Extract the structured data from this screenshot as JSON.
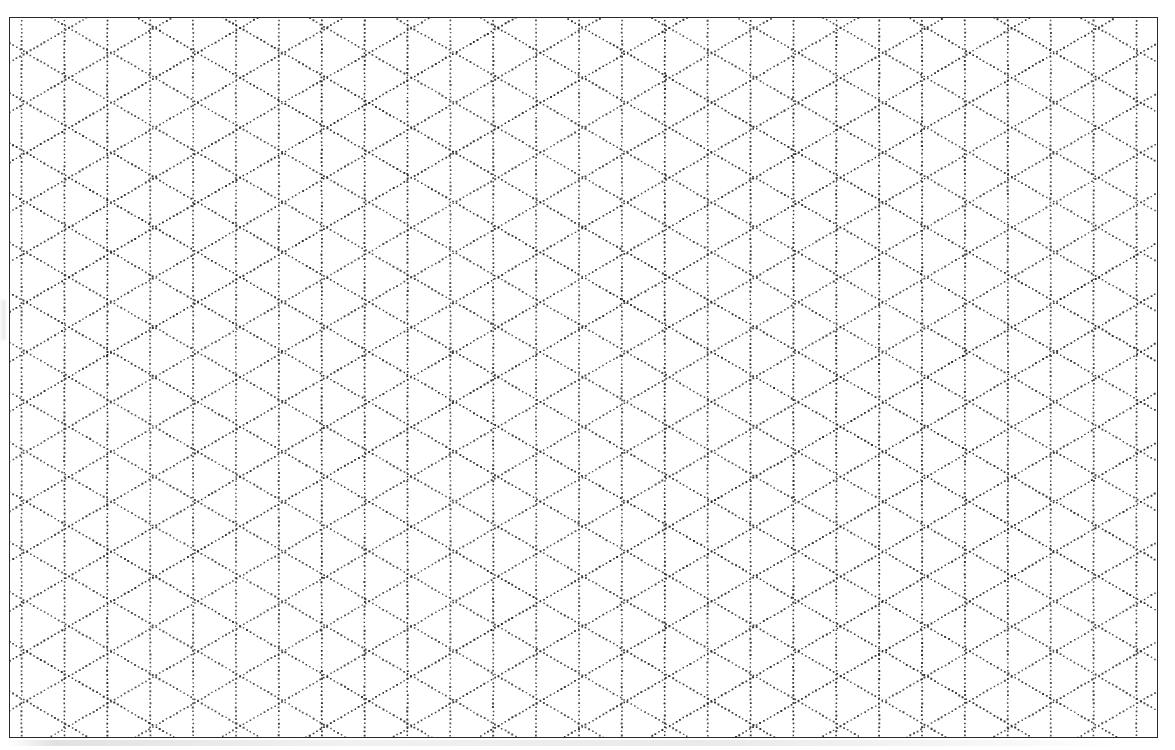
{
  "document": {
    "kind": "isometric-dot-grid-paper",
    "title": "Isometric Dot Grid Paper",
    "page_width": 1175,
    "page_height": 750,
    "background_color": "#ffffff"
  },
  "border": {
    "x": 9,
    "y": 17,
    "width": 1149,
    "height": 721,
    "stroke_color": "#2a2a2a",
    "stroke_width": 1.4
  },
  "grid": {
    "type": "isometric-triangular",
    "dot_color": "#2b2b2b",
    "dot_radius": 0.85,
    "dot_spacing_along_line": 4.05,
    "vertical_line_spacing": 43,
    "node_vertical_spacing": 50,
    "diagonal_angle_degrees": 30,
    "vertical_line_count": 28,
    "diagonal_down_right_count": 52,
    "diagonal_up_right_count": 52,
    "origin_x": 11,
    "origin_y": 19
  },
  "chart_data": {
    "type": "scatter",
    "xlabel": "",
    "ylabel": "",
    "grid": true,
    "legend": "none",
    "xlim": [
      0,
      1149
    ],
    "ylim": [
      0,
      721
    ],
    "series": [
      {
        "name": "vertical dotted lines",
        "orientation_degrees": 90,
        "spacing_px": 43,
        "count": 28
      },
      {
        "name": "diagonal dotted lines (down-right)",
        "orientation_degrees": -30,
        "spacing_px": 43,
        "count": 52
      },
      {
        "name": "diagonal dotted lines (up-right)",
        "orientation_degrees": 30,
        "spacing_px": 43,
        "count": 52
      }
    ]
  }
}
